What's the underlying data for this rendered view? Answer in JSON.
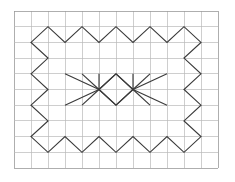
{
  "figure": {
    "background_color": "#ffffff",
    "stroke_color": "#3a3a3a",
    "grid_color": "#b9b9b9",
    "grid_border_color": "#9a9a9a"
  },
  "grid": {
    "origin_x": 14,
    "origin_y": 11,
    "cell_width": 17,
    "cell_height": 15.7,
    "columns": 12,
    "rows": 10,
    "width": 204,
    "height": 157,
    "show_grid": true
  },
  "chart_data": {
    "type": "line",
    "xlabel": "",
    "ylabel": "",
    "xlim": [
      0,
      12
    ],
    "ylim": [
      0,
      10
    ],
    "grid": true,
    "legend": "none",
    "coordinate_note": "Coordinates are in grid-cell units; x increases right from the left border, y increases downward from the top border.",
    "series": [
      {
        "name": "zigzag-border-polygon",
        "closed": true,
        "points": [
          [
            1,
            4
          ],
          [
            2,
            3
          ],
          [
            1,
            2
          ],
          [
            2,
            1
          ],
          [
            3,
            2
          ],
          [
            4,
            1
          ],
          [
            5,
            2
          ],
          [
            6,
            1
          ],
          [
            7,
            2
          ],
          [
            8,
            1
          ],
          [
            9,
            2
          ],
          [
            10,
            1
          ],
          [
            11,
            2
          ],
          [
            10,
            3
          ],
          [
            11,
            4
          ],
          [
            10,
            5
          ],
          [
            11,
            6
          ],
          [
            10,
            7
          ],
          [
            11,
            8
          ],
          [
            10,
            9
          ],
          [
            9,
            8
          ],
          [
            8,
            9
          ],
          [
            7,
            8
          ],
          [
            6,
            9
          ],
          [
            5,
            8
          ],
          [
            4,
            9
          ],
          [
            3,
            8
          ],
          [
            2,
            9
          ],
          [
            1,
            8
          ],
          [
            2,
            7
          ],
          [
            1,
            6
          ],
          [
            2,
            5
          ]
        ]
      },
      {
        "name": "left-fan-node",
        "node": [
          5,
          5
        ],
        "rays": [
          [
            [
              5,
              5
            ],
            [
              3,
              4
            ]
          ],
          [
            [
              5,
              5
            ],
            [
              4,
              4
            ]
          ],
          [
            [
              5,
              5
            ],
            [
              5,
              4
            ]
          ],
          [
            [
              5,
              5
            ],
            [
              6,
              4
            ]
          ],
          [
            [
              5,
              5
            ],
            [
              3,
              6
            ]
          ],
          [
            [
              5,
              5
            ],
            [
              4,
              6
            ]
          ],
          [
            [
              5,
              5
            ],
            [
              6,
              6
            ]
          ]
        ]
      },
      {
        "name": "right-fan-node",
        "node": [
          7,
          5
        ],
        "rays": [
          [
            [
              7,
              5
            ],
            [
              9,
              4
            ]
          ],
          [
            [
              7,
              5
            ],
            [
              8,
              4
            ]
          ],
          [
            [
              7,
              5
            ],
            [
              7,
              4
            ]
          ],
          [
            [
              7,
              5
            ],
            [
              6,
              4
            ]
          ],
          [
            [
              7,
              5
            ],
            [
              9,
              6
            ]
          ],
          [
            [
              7,
              5
            ],
            [
              8,
              6
            ]
          ],
          [
            [
              7,
              5
            ],
            [
              6,
              6
            ]
          ]
        ]
      },
      {
        "name": "center-diamond",
        "points": [
          [
            5,
            5
          ],
          [
            6,
            4
          ],
          [
            7,
            5
          ],
          [
            6,
            6
          ],
          [
            5,
            5
          ]
        ]
      }
    ]
  }
}
